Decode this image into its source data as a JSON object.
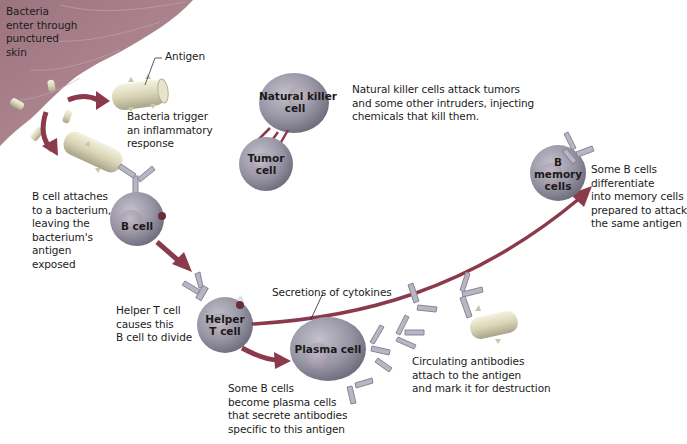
{
  "diagram": {
    "type": "immune-response-flow",
    "colors": {
      "skin": "#a8808a",
      "skin_dark": "#8a6470",
      "arrow": "#8b3a4c",
      "cell": "#9a97a6",
      "cell_dark": "#6e6b7c",
      "nucleus": "#b3a9b6",
      "bacterium": "#e9e5c8",
      "antibody": "#b9b4c2",
      "marker": "#6a2d3c"
    },
    "cells": {
      "natural_killer": "Natural killer\ncell",
      "tumor": "Tumor\ncell",
      "b_cell": "B cell",
      "helper_t": "Helper\nT cell",
      "plasma": "Plasma cell",
      "b_memory": "B\nmemory\ncells"
    },
    "labels": {
      "bacteria_enter": "Bacteria\nenter through\npunctured\nskin",
      "antigen": "Antigen",
      "inflammatory": "Bacteria trigger\nan inflammatory\nresponse",
      "nk_desc": "Natural killer cells attack tumors\nand some other intruders, injecting\nchemicals that kill them.",
      "b_attach": "B cell attaches\nto a bacterium,\nleaving the\nbacterium's\nantigen\nexposed",
      "helper_desc": "Helper T cell\ncauses this\nB cell to divide",
      "cytokines": "Secretions of cytokines",
      "plasma_desc": "Some B cells\nbecome plasma cells\nthat secrete antibodies\nspecific to this antigen",
      "circulating": "Circulating antibodies\nattach to the antigen\nand mark it for destruction",
      "memory_desc": "Some B cells\ndifferentiate\ninto memory cells\nprepared to attack\nthe same antigen"
    }
  }
}
